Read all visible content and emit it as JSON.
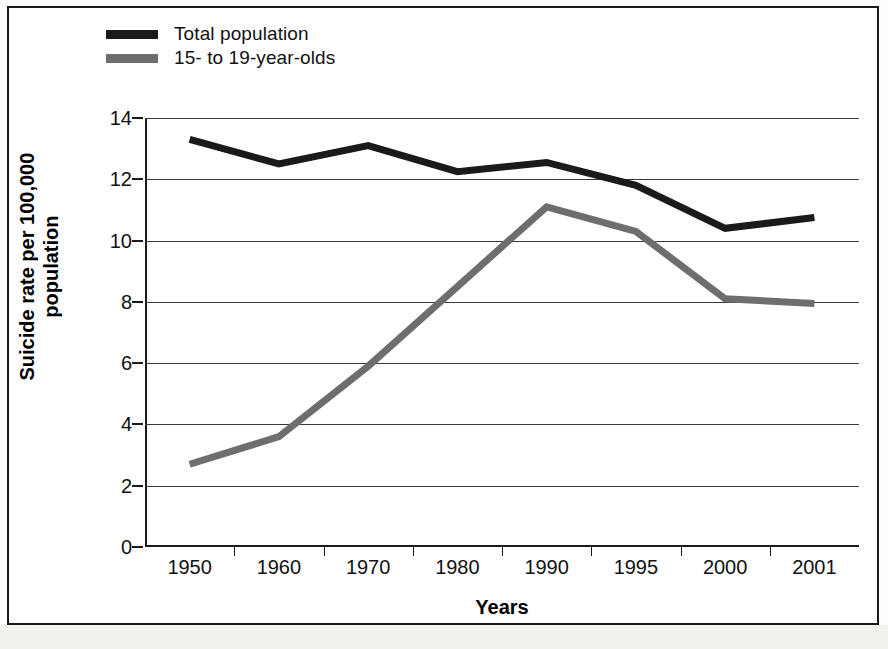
{
  "figure": {
    "background_color": "#ffffff",
    "frame_color": "#1a1a1a"
  },
  "legend": {
    "position": "top-left",
    "entries": [
      {
        "label": "Total population",
        "color": "#1a1a1a",
        "swatch_name": "legend-swatch-total-population"
      },
      {
        "label": "15- to 19-year-olds",
        "color": "#6e6e6e",
        "swatch_name": "legend-swatch-teens"
      }
    ]
  },
  "axes": {
    "ylabel_line1": "Suicide rate per 100,000",
    "ylabel_line2": "population",
    "xlabel": "Years",
    "yticks": [
      "0",
      "2",
      "4",
      "6",
      "8",
      "10",
      "12",
      "14"
    ],
    "xticks": [
      "1950",
      "1960",
      "1970",
      "1980",
      "1990",
      "1995",
      "2000",
      "2001"
    ]
  },
  "chart_data": {
    "type": "line",
    "title": "",
    "xlabel": "Years",
    "ylabel": "Suicide rate per 100,000 population",
    "categories": [
      "1950",
      "1960",
      "1970",
      "1980",
      "1990",
      "1995",
      "2000",
      "2001"
    ],
    "ylim": [
      0,
      14
    ],
    "ytick_step": 2,
    "grid": true,
    "legend_position": "top-left",
    "series": [
      {
        "name": "Total population",
        "color": "#1a1a1a",
        "line_width": 7,
        "values": [
          13.3,
          12.5,
          13.1,
          12.25,
          12.55,
          11.8,
          10.4,
          10.75
        ]
      },
      {
        "name": "15- to 19-year-olds",
        "color": "#6e6e6e",
        "line_width": 7,
        "values": [
          2.7,
          3.6,
          5.9,
          8.5,
          11.1,
          10.3,
          8.1,
          7.95
        ]
      }
    ]
  }
}
